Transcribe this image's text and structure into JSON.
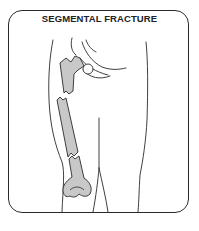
{
  "figure": {
    "title": "SEGMENTAL FRACTURE",
    "colors": {
      "outline": "#2a2a2a",
      "bone_fill": "#c8c8c8",
      "background": "#ffffff"
    }
  }
}
